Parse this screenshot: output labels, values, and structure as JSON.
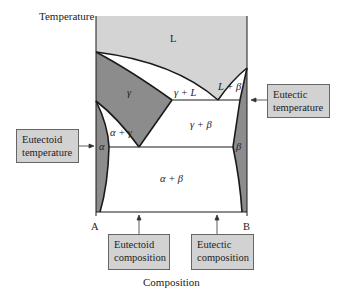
{
  "diagram": {
    "type": "binary-phase-diagram",
    "y_axis_label": "Temperature",
    "x_axis_label": "Composition",
    "component_left": "A",
    "component_right": "B",
    "regions": {
      "liquid": "L",
      "gamma": "γ",
      "gamma_plus_liquid": "γ + L",
      "liquid_plus_beta": "L + β",
      "alpha_plus_gamma": "α + γ",
      "gamma_plus_beta": "γ + β",
      "alpha": "α",
      "beta": "β",
      "alpha_plus_beta": "α + β"
    },
    "callouts": {
      "eutectoid_temperature": [
        "Eutectoid",
        "temperature"
      ],
      "eutectic_temperature": [
        "Eutectic",
        "temperature"
      ],
      "eutectoid_composition": [
        "Eutectoid",
        "composition"
      ],
      "eutectic_composition": [
        "Eutectic",
        "composition"
      ]
    },
    "colors": {
      "liquid_fill": "#d4d4d4",
      "solid_solution_fill": "#8c8c8c",
      "two_phase_fill": "#ffffff",
      "callout_fill": "#d2d2d2",
      "line": "#1a1a1a"
    }
  }
}
